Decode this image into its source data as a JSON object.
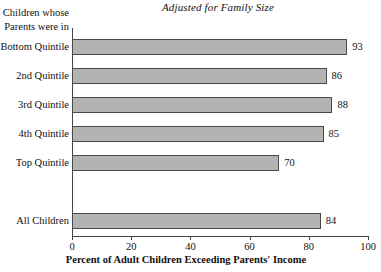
{
  "chart_data": {
    "type": "bar",
    "orientation": "horizontal",
    "title": "Adjusted for Family Size",
    "xlabel": "Percent of Adult Children Exceeding Parents' Income",
    "ylabel": "",
    "y_axis_header": [
      "Children whose",
      "Parents were in"
    ],
    "categories": [
      "Bottom Quintile",
      "2nd Quintile",
      "3rd Quintile",
      "4th Quintile",
      "Top Quintile",
      "All Children"
    ],
    "values": [
      93,
      86,
      88,
      85,
      70,
      84
    ],
    "value_labels": [
      "93",
      "86",
      "88",
      "85",
      "70",
      "84"
    ],
    "xlim": [
      0,
      100
    ],
    "xticks": [
      0,
      20,
      40,
      60,
      80,
      100
    ],
    "xtick_labels": [
      "0",
      "20",
      "40",
      "60",
      "80",
      "100"
    ],
    "grid": false,
    "legend": false,
    "bar_fill_color": "#b3b3b3",
    "bar_edge_color": "#4a4a4a",
    "axis_color": "#444444",
    "background_color": "#ffffff",
    "separated_last_category": true
  }
}
